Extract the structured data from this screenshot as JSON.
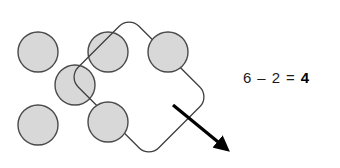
{
  "canvas": {
    "width": 340,
    "height": 168,
    "background": "#ffffff"
  },
  "style": {
    "counter_fill": "#d8d8d8",
    "counter_stroke": "#4a4a4a",
    "group_stroke": "#3f3f3f",
    "arrow_color": "#000000",
    "text_color": "#1b1b1b"
  },
  "diagram": {
    "total_counters": 6,
    "counters": [
      {
        "id": "counter-1",
        "cx": 38,
        "cy": 52,
        "r": 20,
        "grouped": false
      },
      {
        "id": "counter-2",
        "cx": 108,
        "cy": 52,
        "r": 20,
        "grouped": false
      },
      {
        "id": "counter-3",
        "cx": 75,
        "cy": 85,
        "r": 20,
        "grouped": false
      },
      {
        "id": "counter-4",
        "cx": 38,
        "cy": 125,
        "r": 20,
        "grouped": false
      },
      {
        "id": "counter-5",
        "cx": 168,
        "cy": 52,
        "r": 20,
        "grouped": true
      },
      {
        "id": "counter-6",
        "cx": 108,
        "cy": 122,
        "r": 20,
        "grouped": true
      }
    ],
    "group_lasso": {
      "label": "take-away-group",
      "counters_enclosed": 2,
      "rotation_deg": -45,
      "corner_radius": 14
    },
    "arrow": {
      "label": "take-away-arrow",
      "from_x": 173,
      "from_y": 105,
      "to_x": 228,
      "to_y": 150
    }
  },
  "equation": {
    "minuend": "6",
    "operator": "–",
    "subtrahend": "2",
    "equals": "=",
    "difference": "4",
    "full_text": "6 – 2 = 4"
  }
}
